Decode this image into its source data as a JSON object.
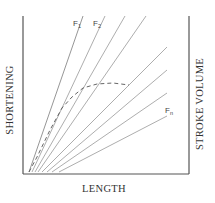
{
  "diagram": {
    "x_label": "LENGTH",
    "y_label_left": "SHORTENING",
    "y_label_right": "STROKE VOLUME",
    "frame": {
      "left": 23,
      "top": 16,
      "right": 189,
      "bottom": 174
    },
    "colors": {
      "frame": "#555555",
      "lines": "#8a8a8a",
      "dashed": "#555555",
      "text": "#333333"
    },
    "fan_lines": [
      {
        "x1": 29,
        "y1": 172,
        "x2": 83,
        "y2": 16
      },
      {
        "x1": 32,
        "y1": 172,
        "x2": 105,
        "y2": 16
      },
      {
        "x1": 35,
        "y1": 172,
        "x2": 125,
        "y2": 16
      },
      {
        "x1": 38,
        "y1": 172,
        "x2": 146,
        "y2": 16
      },
      {
        "x1": 42,
        "y1": 172,
        "x2": 167,
        "y2": 47
      },
      {
        "x1": 47,
        "y1": 172,
        "x2": 167,
        "y2": 70
      },
      {
        "x1": 52,
        "y1": 172,
        "x2": 167,
        "y2": 93
      },
      {
        "x1": 59,
        "y1": 172,
        "x2": 167,
        "y2": 116
      }
    ],
    "line_labels": [
      {
        "main": "F",
        "sub": "1",
        "x": 73,
        "y": 26
      },
      {
        "main": "F",
        "sub": "2",
        "x": 93,
        "y": 26
      },
      {
        "main": "F",
        "sub": "n",
        "x": 165,
        "y": 113
      }
    ],
    "dashed_curve": {
      "points": [
        [
          29,
          172
        ],
        [
          37,
          157
        ],
        [
          50,
          130
        ],
        [
          62,
          108
        ],
        [
          72,
          97
        ],
        [
          83,
          88
        ],
        [
          97,
          84
        ],
        [
          113,
          83
        ],
        [
          129,
          85
        ]
      ]
    }
  }
}
